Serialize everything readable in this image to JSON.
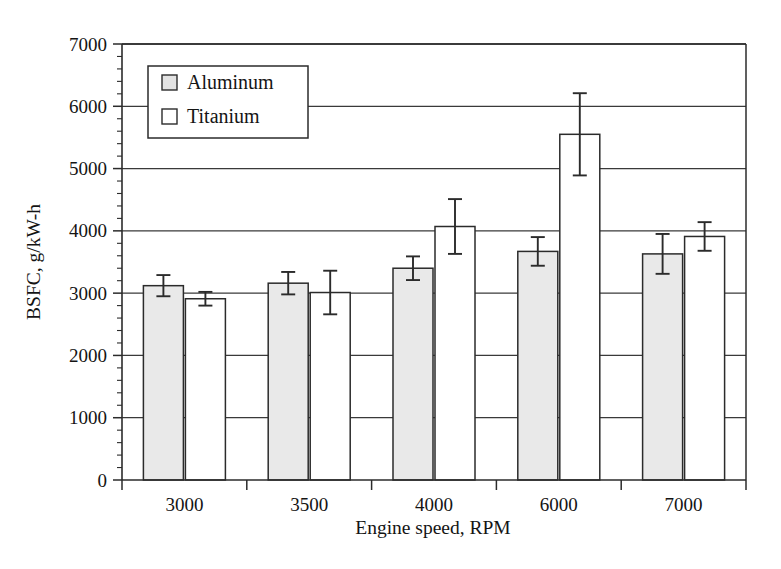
{
  "chart_data": {
    "type": "bar",
    "title": "",
    "xlabel": "Engine speed, RPM",
    "ylabel": "BSFC, g/kW-h",
    "categories": [
      "3000",
      "3500",
      "4000",
      "6000",
      "7000"
    ],
    "ylim": [
      0,
      7000
    ],
    "ytick_labels": [
      "0",
      "1000",
      "2000",
      "3000",
      "4000",
      "5000",
      "6000",
      "7000"
    ],
    "ytick_values": [
      0,
      1000,
      2000,
      3000,
      4000,
      5000,
      6000,
      7000
    ],
    "yminor_interval": 200,
    "grid": "horizontal",
    "legend_position": "upper-left-inside",
    "series": [
      {
        "name": "Aluminum",
        "fill": "#e9e9e9",
        "values": [
          3120,
          3160,
          3400,
          3670,
          3630
        ],
        "errors": [
          170,
          180,
          190,
          230,
          320
        ]
      },
      {
        "name": "Titanium",
        "fill": "#ffffff",
        "values": [
          2910,
          3010,
          4070,
          5550,
          3910
        ],
        "errors": [
          110,
          350,
          440,
          660,
          230
        ]
      }
    ]
  },
  "legend": {
    "items": [
      {
        "label": "Aluminum",
        "swatch": "filled-gray-square"
      },
      {
        "label": "Titanium",
        "swatch": "empty-white-square"
      }
    ]
  },
  "colors": {
    "aluminum_fill": "#e9e9e9",
    "titanium_fill": "#ffffff",
    "line": "#2b2b2b",
    "background": "#ffffff"
  }
}
